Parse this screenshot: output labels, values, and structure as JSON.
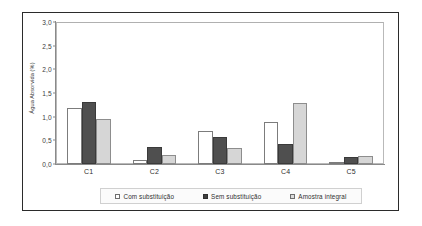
{
  "chart_data": {
    "type": "bar",
    "title": "",
    "xlabel": "",
    "ylabel": "Água Absorvida (%)",
    "categories": [
      "C1",
      "C2",
      "C3",
      "C4",
      "C5"
    ],
    "series": [
      {
        "name": "Com substituição",
        "color": "#ffffff",
        "values": [
          1.18,
          0.08,
          0.7,
          0.88,
          0.05
        ]
      },
      {
        "name": "Sem substituição",
        "color": "#4f4f4f",
        "values": [
          1.3,
          0.35,
          0.58,
          0.43,
          0.15
        ]
      },
      {
        "name": "Amostra integral",
        "color": "#d6d6d6",
        "values": [
          0.95,
          0.2,
          0.33,
          1.29,
          0.17
        ]
      }
    ],
    "ylim": [
      0,
      3.0
    ],
    "ytick_values": [
      0,
      0.5,
      1.0,
      1.5,
      2.0,
      2.5,
      3.0
    ],
    "ytick_labels": [
      "0,0",
      "0,5",
      "1,0",
      "1,5",
      "2,0",
      "2,5",
      "3,0"
    ],
    "grid": false,
    "legend_position": "bottom"
  }
}
